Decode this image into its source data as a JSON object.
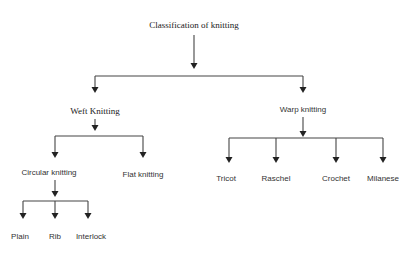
{
  "diagram": {
    "title": "Classification of knitting",
    "nodes": {
      "root": {
        "label": "Classification of knitting",
        "x": 194,
        "y": 25
      },
      "weft": {
        "label": "Weft Knitting",
        "x": 95,
        "y": 111
      },
      "warp": {
        "label": "Warp knitting",
        "x": 303,
        "y": 109
      },
      "circular": {
        "label": "Circular knitting",
        "x": 49,
        "y": 172
      },
      "flat": {
        "label": "Flat knitting",
        "x": 143,
        "y": 174
      },
      "plain": {
        "label": "Plain",
        "x": 20,
        "y": 236
      },
      "rib": {
        "label": "Rib",
        "x": 55,
        "y": 236
      },
      "interlock": {
        "label": "Interlock",
        "x": 91,
        "y": 236
      },
      "tricot": {
        "label": "Tricot",
        "x": 226,
        "y": 178
      },
      "raschel": {
        "label": "Raschel",
        "x": 276,
        "y": 178
      },
      "crochet": {
        "label": "Crochet",
        "x": 336,
        "y": 178
      },
      "milanese": {
        "label": "Milanese",
        "x": 383,
        "y": 178
      }
    },
    "edges": [
      [
        "root",
        "weft"
      ],
      [
        "root",
        "warp"
      ],
      [
        "weft",
        "circular"
      ],
      [
        "weft",
        "flat"
      ],
      [
        "circular",
        "plain"
      ],
      [
        "circular",
        "rib"
      ],
      [
        "circular",
        "interlock"
      ],
      [
        "warp",
        "tricot"
      ],
      [
        "warp",
        "raschel"
      ],
      [
        "warp",
        "crochet"
      ],
      [
        "warp",
        "milanese"
      ]
    ],
    "colors": {
      "line": "#444444",
      "text": "#333333",
      "background": "#ffffff"
    }
  }
}
